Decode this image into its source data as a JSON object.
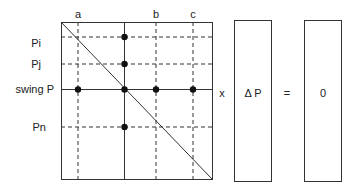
{
  "diagram": {
    "matrix": {
      "column_labels": [
        "a",
        "b",
        "c"
      ],
      "row_labels": [
        "Pi",
        "Pj",
        "swing P",
        "Pn"
      ]
    },
    "operators": {
      "multiply": "x",
      "equals": "="
    },
    "vector_delta": {
      "label": "Δ P"
    },
    "vector_result": {
      "label": "0"
    },
    "colors": {
      "line": "#333333",
      "dot": "#111111",
      "background": "#ffffff"
    }
  }
}
